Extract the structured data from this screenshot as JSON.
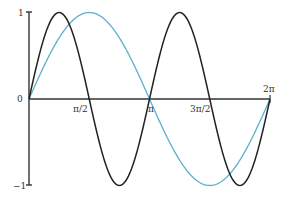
{
  "chart_data": {
    "type": "line",
    "title": "",
    "xlabel": "",
    "ylabel": "",
    "xlim": [
      0,
      6.2832
    ],
    "ylim": [
      -1,
      1
    ],
    "grid": false,
    "legend": null,
    "x_ticks": [
      {
        "value": 1.5708,
        "label": "π/2"
      },
      {
        "value": 3.1416,
        "label": "π"
      },
      {
        "value": 4.7124,
        "label": "3π/2"
      },
      {
        "value": 6.2832,
        "label": "2π"
      }
    ],
    "y_ticks": [
      {
        "value": 1,
        "label": "1"
      },
      {
        "value": 0,
        "label": "0"
      },
      {
        "value": -1,
        "label": "−1"
      }
    ],
    "series": [
      {
        "name": "sin(x)",
        "color": "#5bb0cc",
        "function": "sin(x)",
        "x": [
          0,
          0.7854,
          1.5708,
          2.3562,
          3.1416,
          3.927,
          4.7124,
          5.4978,
          6.2832
        ],
        "values": [
          0,
          0.707,
          1,
          0.707,
          0,
          -0.707,
          -1,
          -0.707,
          0
        ]
      },
      {
        "name": "sin(2x)",
        "color": "#222222",
        "function": "sin(2x)",
        "x": [
          0,
          0.7854,
          1.5708,
          2.3562,
          3.1416,
          3.927,
          4.7124,
          5.4978,
          6.2832
        ],
        "values": [
          0,
          1,
          0,
          -1,
          0,
          1,
          0,
          -1,
          0
        ]
      }
    ]
  },
  "labels": {
    "y_top": "1",
    "y_zero": "0",
    "y_bottom": "−1",
    "x_pi_half": "π/2",
    "x_pi": "π",
    "x_three_pi_half": "3π/2",
    "x_two_pi": "2π"
  }
}
